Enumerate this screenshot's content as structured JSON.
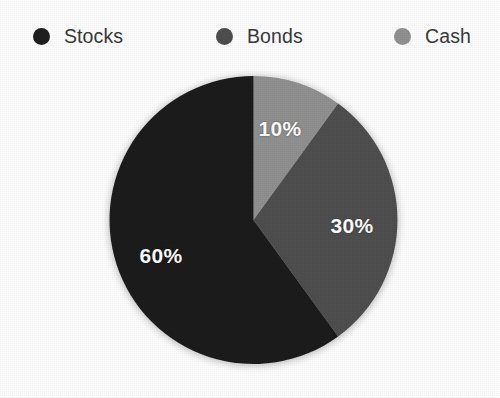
{
  "legend": {
    "position": "top",
    "items": [
      {
        "label": "Stocks",
        "color": "#1f1f1f",
        "swatch_icon": "circle-swatch-icon"
      },
      {
        "label": "Bonds",
        "color": "#4f4f4f",
        "swatch_icon": "circle-swatch-icon"
      },
      {
        "label": "Cash",
        "color": "#919191",
        "swatch_icon": "circle-swatch-icon"
      }
    ]
  },
  "labels": {
    "cash": "10%",
    "bonds": "30%",
    "stocks": "60%"
  },
  "chart_data": {
    "type": "pie",
    "title": "",
    "categories": [
      "Stocks",
      "Bonds",
      "Cash"
    ],
    "values": [
      60,
      30,
      10
    ],
    "value_unit": "%",
    "data_labels": [
      "60%",
      "30%",
      "10%"
    ],
    "colors": [
      "#1f1f1f",
      "#4f4f4f",
      "#919191"
    ],
    "legend": [
      "Stocks",
      "Bonds",
      "Cash"
    ],
    "legend_position": "top",
    "start_angle_deg": 0,
    "direction": "clockwise",
    "grid": false,
    "slices": [
      {
        "name": "Cash",
        "value": 10,
        "label": "10%",
        "color": "#919191",
        "start_deg": 0,
        "end_deg": 36
      },
      {
        "name": "Bonds",
        "value": 30,
        "label": "30%",
        "color": "#4f4f4f",
        "start_deg": 36,
        "end_deg": 144
      },
      {
        "name": "Stocks",
        "value": 60,
        "label": "60%",
        "color": "#1f1f1f",
        "start_deg": 144,
        "end_deg": 360
      }
    ]
  }
}
